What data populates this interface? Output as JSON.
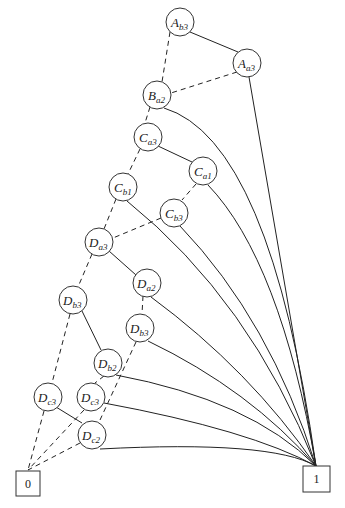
{
  "diagram": {
    "type": "binary decision diagram",
    "nodes": [
      {
        "id": "n1",
        "var": "A",
        "sub": "b3",
        "x": 180,
        "y": 22
      },
      {
        "id": "n2",
        "var": "A",
        "sub": "a3",
        "x": 247,
        "y": 63
      },
      {
        "id": "n3",
        "var": "B",
        "sub": "a2",
        "x": 157,
        "y": 95
      },
      {
        "id": "n4",
        "var": "C",
        "sub": "a3",
        "x": 148,
        "y": 137
      },
      {
        "id": "n5",
        "var": "C",
        "sub": "a1",
        "x": 203,
        "y": 171
      },
      {
        "id": "n6",
        "var": "C",
        "sub": "b1",
        "x": 123,
        "y": 187
      },
      {
        "id": "n7",
        "var": "C",
        "sub": "b3",
        "x": 174,
        "y": 213
      },
      {
        "id": "n8",
        "var": "D",
        "sub": "a3",
        "x": 99,
        "y": 242
      },
      {
        "id": "n9",
        "var": "D",
        "sub": "a2",
        "x": 147,
        "y": 283
      },
      {
        "id": "n10",
        "var": "D",
        "sub": "b3",
        "x": 73,
        "y": 300
      },
      {
        "id": "n11",
        "var": "D",
        "sub": "b3",
        "x": 140,
        "y": 328
      },
      {
        "id": "n12",
        "var": "D",
        "sub": "b2",
        "x": 108,
        "y": 363
      },
      {
        "id": "n13",
        "var": "D",
        "sub": "c3",
        "x": 48,
        "y": 397
      },
      {
        "id": "n14",
        "var": "D",
        "sub": "c3",
        "x": 91,
        "y": 397
      },
      {
        "id": "n15",
        "var": "D",
        "sub": "c2",
        "x": 92,
        "y": 435
      }
    ],
    "terminals": [
      {
        "id": "t0",
        "label": "0",
        "x": 16,
        "y": 471,
        "w": 24,
        "h": 25
      },
      {
        "id": "t1",
        "label": "1",
        "x": 303,
        "y": 466,
        "w": 27,
        "h": 26
      }
    ]
  }
}
